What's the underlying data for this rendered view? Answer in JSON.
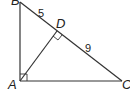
{
  "diagram": {
    "type": "right-triangle-with-altitude",
    "points": {
      "A": {
        "label": "A",
        "x": 20,
        "y": 81
      },
      "B": {
        "label": "B",
        "x": 19,
        "y": 2
      },
      "C": {
        "label": "C",
        "x": 122,
        "y": 81
      },
      "D": {
        "label": "D",
        "x": 57,
        "y": 31
      }
    },
    "segments": [
      {
        "from": "A",
        "to": "B"
      },
      {
        "from": "B",
        "to": "C"
      },
      {
        "from": "A",
        "to": "C"
      },
      {
        "from": "A",
        "to": "D"
      }
    ],
    "right_angles": [
      "A",
      "D"
    ],
    "measures": {
      "BD": "5",
      "DC": "9"
    },
    "colors": {
      "stroke": "#333333",
      "background": "#ffffff"
    }
  }
}
